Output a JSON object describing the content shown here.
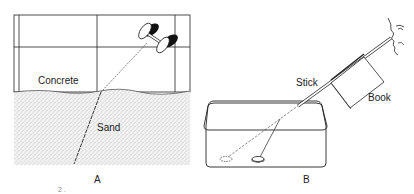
{
  "figure": {
    "panel_a": {
      "caption": "A",
      "labels": {
        "top_region": "Concrete",
        "bottom_region": "Sand"
      }
    },
    "panel_b": {
      "caption": "B",
      "labels": {
        "stick": "Stick",
        "book": "Book"
      }
    },
    "footer_fragment": "2 ."
  }
}
